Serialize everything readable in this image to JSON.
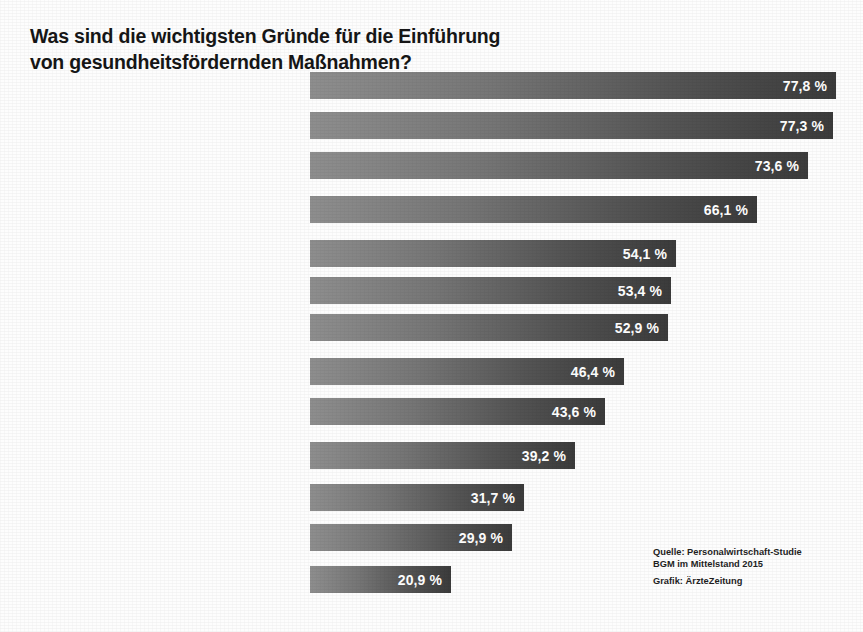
{
  "title": {
    "line1": "Was sind die wichtigsten Gründe für die Einführung",
    "line2": "von gesundheitsfördernden Maßnahmen?"
  },
  "source": {
    "line1": "Quelle: Personalwirtschaft-Studie",
    "line2": "BGM im Mittelstand 2015",
    "line3": "Grafik: ÄrzteZeitung"
  },
  "colors": {
    "bar_light": "#8e8e8e",
    "bar_dark": "#3b3b3b",
    "value_text": "#ffffff",
    "label_text": "#1b1b1b",
    "background": "#fdfdfd"
  },
  "chart_data": {
    "type": "bar",
    "orientation": "horizontal",
    "title": "Was sind die wichtigsten Gründe für die Einführung von gesundheitsfördernden Maßnahmen?",
    "xlabel": "",
    "ylabel": "",
    "xlim": [
      0,
      77.8
    ],
    "grid": false,
    "legend": null,
    "unit": "%",
    "decimal_separator": ",",
    "categories": [
      "Steigerung der Arbeitszufriedenheit",
      "Verbesserung des psychischen Befindens der Mitarbeiter",
      "Verbesserung des physischen Befindens der Mitarbeiter",
      "Senkung der Fehlzeiten",
      "Stärkung der persönlichen Gesundheitskompetenz der Mitarbeiter",
      "Steigerung der Leistungsfähigkeit / Wettbewerbsfähigkeit / Produktivität",
      "Verbesserung des Betriebsklimas",
      "Verbesserung des Arbeitgeberimages",
      "Stärkung der Eigenverantwortung der Mitarbeiter",
      "Qualitätssteigerung",
      "Senkung der Fluktuationsrate",
      "Gesetzliche Anforderungen erfüllen",
      "Senkung der Arbeitsunfallzahlen"
    ],
    "values": [
      77.8,
      77.3,
      73.6,
      66.1,
      54.1,
      53.4,
      52.9,
      46.4,
      43.6,
      39.2,
      31.7,
      29.9,
      20.9
    ],
    "value_labels": [
      "77,8 %",
      "77,3 %",
      "73,6 %",
      "66,1 %",
      "54,1 %",
      "53,4 %",
      "52,9 %",
      "46,4 %",
      "43,6 %",
      "39,2 %",
      "31,7 %",
      "29,9 %",
      "20,9 %"
    ]
  },
  "rows": [
    {
      "value_label": "77,8 %",
      "value": 77.8,
      "top": 72,
      "lines": [
        [
          {
            "t": "Steigerung der",
            "b": false
          }
        ],
        [
          {
            "t": "Arbeitszufriedenheit",
            "b": true
          }
        ]
      ]
    },
    {
      "value_label": "77,3 %",
      "value": 77.3,
      "top": 112,
      "lines": [
        [
          {
            "t": "Verbesserung des ",
            "b": false
          },
          {
            "t": "psychischen",
            "b": true
          }
        ],
        [
          {
            "t": "Befindens",
            "b": true
          },
          {
            "t": " der Mitarbeiter",
            "b": false
          }
        ]
      ]
    },
    {
      "value_label": "73,6 %",
      "value": 73.6,
      "top": 152,
      "lines": [
        [
          {
            "t": "Verbesserung des ",
            "b": false
          },
          {
            "t": "physischen",
            "b": true
          }
        ],
        [
          {
            "t": "Befindens",
            "b": true
          },
          {
            "t": " der Mitarbeiter",
            "b": false
          }
        ]
      ]
    },
    {
      "value_label": "66,1 %",
      "value": 66.1,
      "top": 196,
      "lines": [
        [
          {
            "t": "Senkung der ",
            "b": false
          },
          {
            "t": "Fehlzeiten",
            "b": true
          }
        ]
      ]
    },
    {
      "value_label": "54,1 %",
      "value": 54.1,
      "top": 240,
      "lines": [
        [
          {
            "t": "Stärkung der persönlichen",
            "b": false
          }
        ],
        [
          {
            "t": "Gesundheitskompetenz",
            "b": true
          },
          {
            "t": " der Mitarbeiter",
            "b": false
          }
        ]
      ]
    },
    {
      "value_label": "53,4 %",
      "value": 53.4,
      "top": 277,
      "lines": [
        [
          {
            "t": "Steigerung der ",
            "b": false
          },
          {
            "t": "Leistungsfähigkeit /",
            "b": true
          }
        ],
        [
          {
            "t": "Wettbewerbsfähigkeit / Produktivität",
            "b": true
          }
        ]
      ]
    },
    {
      "value_label": "52,9 %",
      "value": 52.9,
      "top": 314,
      "lines": [
        [
          {
            "t": "Verbesserung des ",
            "b": false
          },
          {
            "t": "Betriebsklimas",
            "b": true
          }
        ]
      ]
    },
    {
      "value_label": "46,4 %",
      "value": 46.4,
      "top": 358,
      "lines": [
        [
          {
            "t": "Verbesserung des ",
            "b": false
          },
          {
            "t": "Arbeitgeberimages",
            "b": true
          }
        ]
      ]
    },
    {
      "value_label": "43,6 %",
      "value": 43.6,
      "top": 398,
      "lines": [
        [
          {
            "t": "Stärkung der ",
            "b": false
          },
          {
            "t": "Eigenverantwortung",
            "b": true
          }
        ],
        [
          {
            "t": "der Mitarbeiter",
            "b": false
          }
        ]
      ]
    },
    {
      "value_label": "39,2 %",
      "value": 39.2,
      "top": 442,
      "lines": [
        [
          {
            "t": "Qualitätssteigerung",
            "b": true
          }
        ]
      ]
    },
    {
      "value_label": "31,7 %",
      "value": 31.7,
      "top": 484,
      "lines": [
        [
          {
            "t": "Senkung der ",
            "b": false
          },
          {
            "t": "Fluktuationsrate",
            "b": true
          }
        ]
      ]
    },
    {
      "value_label": "29,9 %",
      "value": 29.9,
      "top": 524,
      "lines": [
        [
          {
            "t": "Gesetzliche Anforderungen",
            "b": true
          },
          {
            "t": " erfüllen",
            "b": false
          }
        ]
      ]
    },
    {
      "value_label": "20,9 %",
      "value": 20.9,
      "top": 566,
      "lines": [
        [
          {
            "t": "Senkung der ",
            "b": false
          },
          {
            "t": "Arbeitsunfallzahlen",
            "b": true
          }
        ]
      ]
    }
  ],
  "scale": {
    "bar_origin_x": 310,
    "px_per_percent": 6.76,
    "bar_height": 27
  }
}
